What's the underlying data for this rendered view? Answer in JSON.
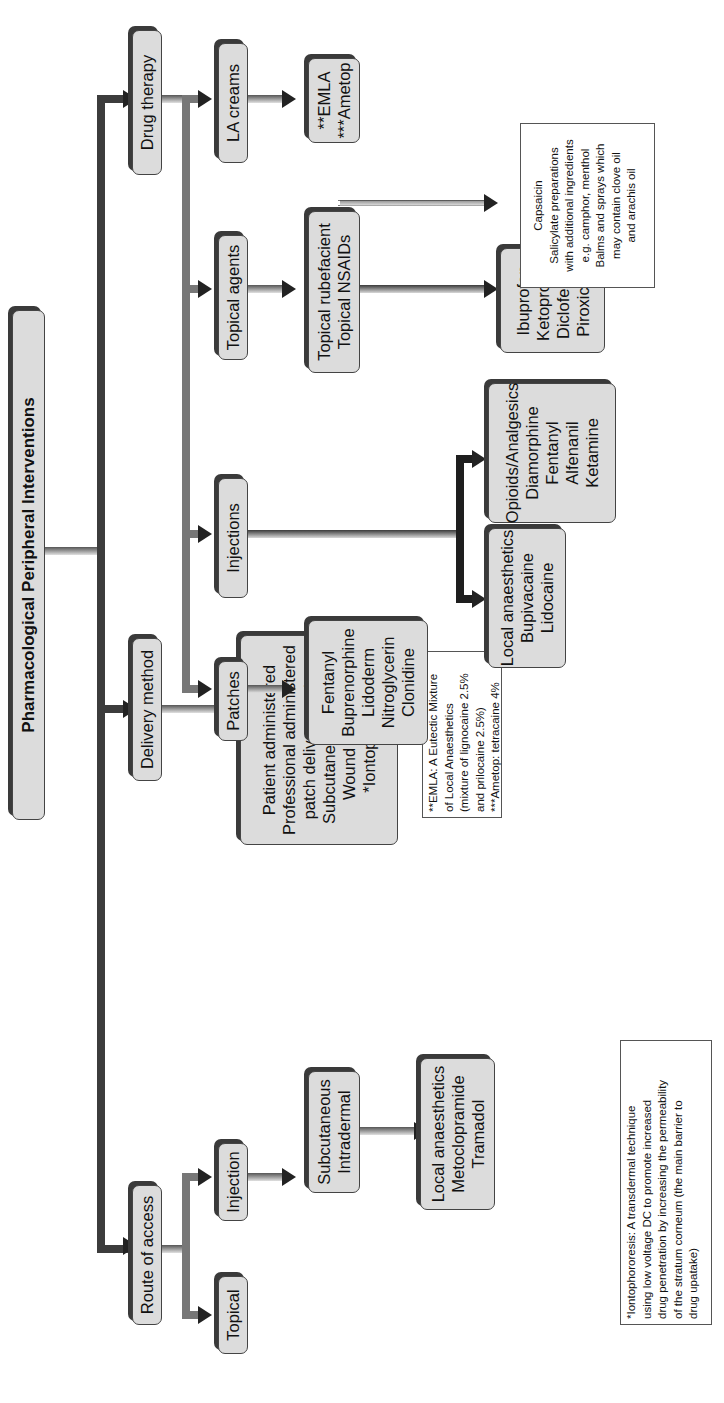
{
  "title": "Pharmacological Peripheral Interventions",
  "branches": {
    "route_of_access": {
      "label": "Route of access",
      "topical": "Topical",
      "injection": "Injection",
      "injection_types": [
        "Subcutaneous",
        "Intradermal"
      ],
      "injection_drugs": [
        "Local anaesthetics",
        "Metoclopramide",
        "Tramadol"
      ]
    },
    "delivery_method": {
      "label": "Delivery method",
      "items": [
        "Patient administered",
        "Professional administered",
        "patch delivery system",
        "Subcutaneous Infusion",
        "Wound irrigation",
        "*Iontophoresis"
      ]
    },
    "drug_therapy": {
      "label": "Drug therapy",
      "patches": {
        "label": "Patches",
        "items": [
          "Fentanyl",
          "Buprenorphine",
          "Lidoderm",
          "Nitroglycerin",
          "Clonidine"
        ]
      },
      "injections": {
        "label": "Injections",
        "local_anaesthetics": [
          "Local anaesthetics",
          "Bupivacaine",
          "Lidocaine"
        ],
        "opioids": [
          "Opioids/Analgesics",
          "Diamorphine",
          "Fentanyl",
          "Alfenanil",
          "Ketamine"
        ]
      },
      "topical_agents": {
        "label": "Topical agents",
        "sub": [
          "Topical rubefacient",
          "Topical NSAIDs"
        ],
        "nsaids": [
          "Ibuprofen",
          "Ketoprofen",
          "Diclofenac",
          "Piroxicam"
        ],
        "rubefacient_note": [
          "Capsaicin",
          "Salicylate preparations",
          "with additional ingredients",
          "e.g. camphor, menthol",
          "Balms and sprays which",
          "may contain clove oil",
          "and arachis oil"
        ]
      },
      "la_creams": {
        "label": "LA creams",
        "items": [
          "**EMLA",
          "***Ametop"
        ]
      }
    }
  },
  "footnotes": {
    "iontophoresis": [
      "*Iontophororesis: A transdermal technique",
      "using low voltage DC to promote increased",
      "drug penetration by increasing the permeability",
      "of the stratum corneum (the main barrier to",
      "drug upatake)"
    ],
    "emla": [
      "**EMLA: A Eutectic Mixture",
      "of Local Anaesthetics",
      "(mixture of lignocaine 2.5%",
      "and prilocaine 2.5%)",
      "***Ametop: tetracaine 4%"
    ]
  }
}
